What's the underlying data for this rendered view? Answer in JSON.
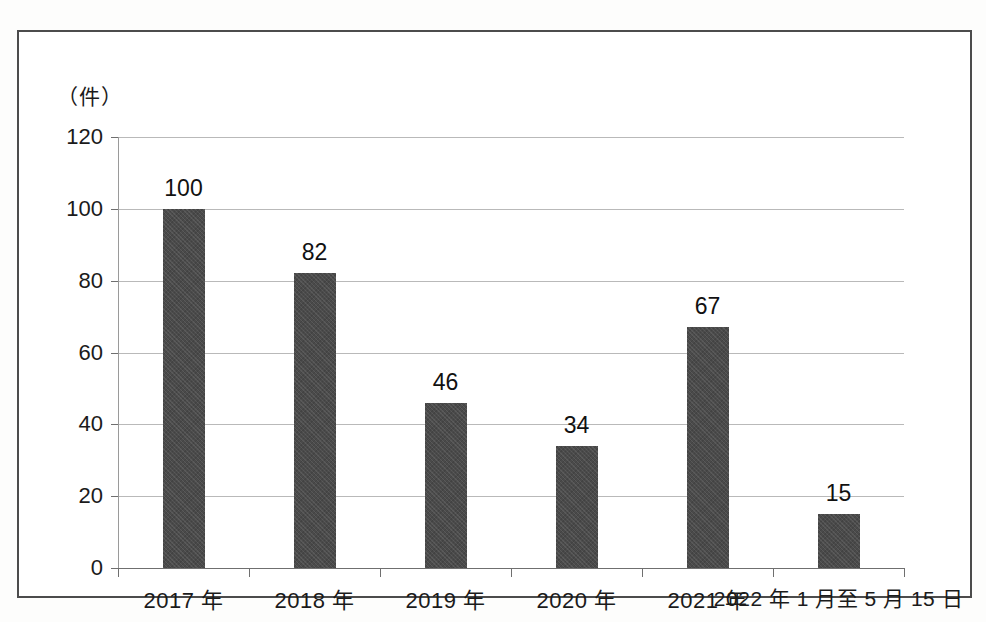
{
  "chart_data": {
    "type": "bar",
    "title": "",
    "subtitle": "",
    "xlabel": "",
    "ylabel": "（件）",
    "unit_caption": "（件）",
    "categories": [
      "2017 年",
      "2018 年",
      "2019 年",
      "2020 年",
      "2021 年",
      "2022 年 1 月至 5 月 15 日"
    ],
    "values": [
      100,
      82,
      46,
      34,
      67,
      15
    ],
    "data_labels": [
      "100",
      "82",
      "46",
      "34",
      "67",
      "15"
    ],
    "ylim": [
      0,
      120
    ],
    "ytick_labels": [
      "0",
      "20",
      "40",
      "60",
      "80",
      "100",
      "120"
    ],
    "ytick_values": [
      0,
      20,
      40,
      60,
      80,
      100,
      120
    ],
    "grid": true,
    "grid_axis": "y",
    "legend": false,
    "legend_position": "none",
    "bar_color": "#4a4a4a",
    "gridline_color": "#b9b9b9",
    "axis_color": "#6f6f6f",
    "frame_color": "#4c4c4c",
    "background_color": "#ffffff"
  }
}
